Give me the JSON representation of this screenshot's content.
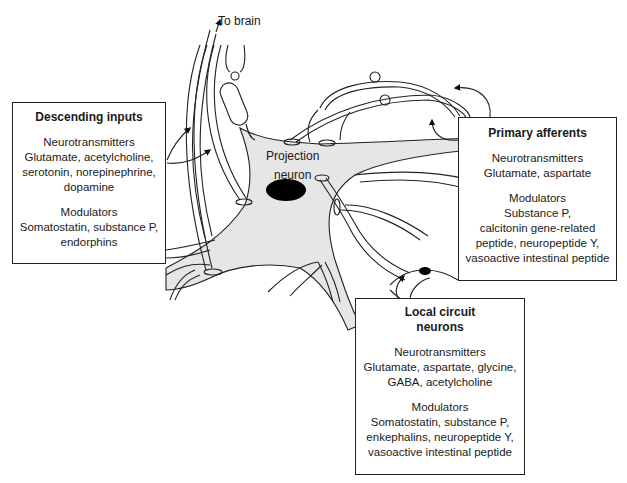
{
  "diagram": {
    "type": "neuron-circuit-illustration",
    "labels": {
      "to_brain": "To brain",
      "projection_neuron_line1": "Projection",
      "projection_neuron_line2": "neuron"
    },
    "colors": {
      "soma_fill": "#e6e6e6",
      "outline": "#222222",
      "nucleus": "#000000"
    }
  },
  "boxes": {
    "descending": {
      "title": "Descending inputs",
      "neurotransmitters_heading": "Neurotransmitters",
      "neurotransmitters_lines": [
        "Glutamate, acetylcholine,",
        "serotonin, norepinephrine,",
        "dopamine"
      ],
      "modulators_heading": "Modulators",
      "modulators_lines": [
        "Somatostatin, substance P,",
        "endorphins"
      ]
    },
    "primary": {
      "title": "Primary afferents",
      "neurotransmitters_heading": "Neurotransmitters",
      "neurotransmitters_lines": [
        "Glutamate, aspartate"
      ],
      "modulators_heading": "Modulators",
      "modulators_lines": [
        "Substance P,",
        "calcitonin gene-related",
        "peptide, neuropeptide Y,",
        "vasoactive intestinal peptide"
      ]
    },
    "local": {
      "title_lines": [
        "Local circuit",
        "neurons"
      ],
      "neurotransmitters_heading": "Neurotransmitters",
      "neurotransmitters_lines": [
        "Glutamate, aspartate, glycine,",
        "GABA, acetylcholine"
      ],
      "modulators_heading": "Modulators",
      "modulators_lines": [
        "Somatostatin, substance P,",
        "enkephalins, neuropeptide Y,",
        "vasoactive intestinal peptide"
      ]
    }
  }
}
